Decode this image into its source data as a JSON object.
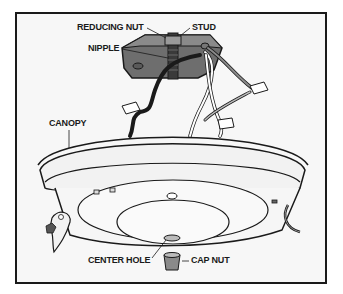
{
  "diagram": {
    "labels": {
      "reducing_nut": "REDUCING NUT",
      "stud": "STUD",
      "nipple": "NIPPLE",
      "canopy": "CANOPY",
      "center_hole": "CENTER HOLE",
      "cap_nut": "CAP NUT"
    },
    "colors": {
      "background": "#f7f7f7",
      "outline": "#1a1a1a",
      "box_fill": "#6e6e6e",
      "canopy_fill": "#f2f2f2",
      "wire_black": "#1a1a1a",
      "wire_white": "#ffffff"
    }
  }
}
